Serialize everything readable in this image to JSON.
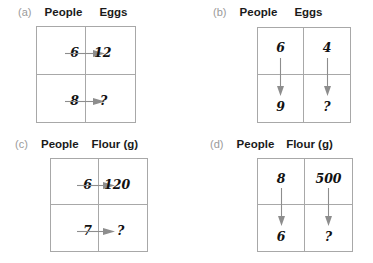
{
  "figure": {
    "title": "",
    "background": "#ffffff",
    "line_color": "#a8a8a8",
    "arrow_color": "#8d8d8d",
    "label_color": "#9a9a9a",
    "text_color": "#111111"
  },
  "panels": [
    {
      "letter": "(a)",
      "headers": [
        "People",
        "Eggs"
      ],
      "arrow_direction": "horizontal",
      "rows": [
        {
          "left": "6",
          "right": "12"
        },
        {
          "left": "8",
          "right": "?"
        }
      ]
    },
    {
      "letter": "(b)",
      "headers": [
        "People",
        "Eggs"
      ],
      "arrow_direction": "vertical",
      "rows": [
        {
          "left": "6",
          "right": "4"
        },
        {
          "left": "9",
          "right": "?"
        }
      ]
    },
    {
      "letter": "(c)",
      "headers": [
        "People",
        "Flour (g)"
      ],
      "arrow_direction": "horizontal",
      "rows": [
        {
          "left": "6",
          "right": "120"
        },
        {
          "left": "7",
          "right": "?"
        }
      ]
    },
    {
      "letter": "(d)",
      "headers": [
        "People",
        "Flour (g)"
      ],
      "arrow_direction": "vertical",
      "rows": [
        {
          "left": "8",
          "right": "500"
        },
        {
          "left": "6",
          "right": "?"
        }
      ]
    }
  ]
}
